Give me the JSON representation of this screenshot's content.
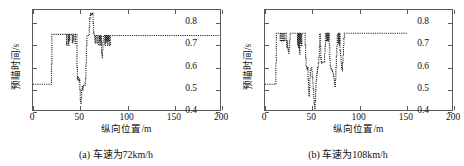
{
  "figure": {
    "background": "#ffffff",
    "axis_color": "#5a5a5a",
    "series_color": "#1a1a1a"
  },
  "panels": [
    {
      "id": "panel-a",
      "caption": "(a) 车速为72km/h",
      "xlabel": "纵向位置/m",
      "ylabel": "预瞄时间/s"
    },
    {
      "id": "panel-b",
      "caption": "(b) 车速为108km/h",
      "xlabel": "纵向位置/m",
      "ylabel": "预瞄时间/s"
    }
  ],
  "chart_data": [
    {
      "type": "line",
      "title": "(a) 车速为72km/h",
      "xlabel": "纵向位置/m",
      "ylabel": "预瞄时间/s",
      "xlim": [
        0,
        200
      ],
      "ylim": [
        0.4,
        0.86
      ],
      "xticks": [
        0,
        50,
        100,
        150,
        200
      ],
      "yticks": [
        0.4,
        0.5,
        0.6,
        0.7,
        0.8
      ],
      "xticklabels": [
        "0",
        "50",
        "100",
        "150",
        "200"
      ],
      "yticklabels": [
        "0.4",
        "0.5",
        "0.6",
        "0.7",
        "0.8"
      ],
      "grid": false,
      "legend": null,
      "linestyle": "dotted",
      "series": [
        {
          "name": "预瞄时间",
          "x": [
            0,
            1,
            2,
            3,
            4,
            5,
            6,
            7,
            8,
            9,
            10,
            11,
            12,
            13,
            14,
            15,
            16,
            17,
            18,
            19,
            19.5,
            20,
            21,
            22,
            23,
            24,
            25,
            26,
            27,
            28,
            29,
            30,
            31,
            32,
            33,
            34,
            35,
            35.5,
            36,
            36.5,
            37,
            37.5,
            38,
            38.5,
            39,
            40,
            41,
            41.5,
            42,
            42.5,
            43,
            43.5,
            44,
            44.5,
            45,
            45.5,
            46,
            46.5,
            47,
            47.5,
            48,
            48.5,
            49,
            49.5,
            50,
            50.5,
            51,
            51.5,
            52,
            52.5,
            53,
            53.5,
            54,
            54.5,
            55,
            55.5,
            56,
            56.5,
            57,
            57.5,
            58,
            58.5,
            59,
            59.5,
            60,
            60.5,
            61,
            61.5,
            62,
            62.5,
            63,
            63.5,
            64,
            64.5,
            65,
            65.5,
            66,
            66.5,
            67,
            67.5,
            68,
            68.5,
            69,
            69.5,
            70,
            70.5,
            71,
            71.5,
            72,
            72.5,
            73,
            73.5,
            74,
            74.5,
            75,
            75.5,
            76,
            76.5,
            77,
            77.5,
            78,
            78.5,
            79,
            79.5,
            80,
            80.5,
            81,
            82,
            83,
            84,
            85,
            90,
            100,
            110,
            120,
            130,
            140,
            150,
            160,
            170,
            180,
            190,
            200
          ],
          "y": [
            0.525,
            0.525,
            0.525,
            0.525,
            0.525,
            0.525,
            0.525,
            0.525,
            0.525,
            0.525,
            0.525,
            0.525,
            0.525,
            0.525,
            0.525,
            0.525,
            0.525,
            0.525,
            0.525,
            0.525,
            0.62,
            0.75,
            0.75,
            0.75,
            0.75,
            0.75,
            0.75,
            0.75,
            0.75,
            0.75,
            0.75,
            0.75,
            0.75,
            0.75,
            0.75,
            0.75,
            0.75,
            0.7,
            0.75,
            0.75,
            0.75,
            0.7,
            0.75,
            0.72,
            0.75,
            0.75,
            0.75,
            0.71,
            0.75,
            0.72,
            0.75,
            0.75,
            0.75,
            0.71,
            0.75,
            0.75,
            0.75,
            0.6,
            0.545,
            0.56,
            0.545,
            0.54,
            0.55,
            0.5,
            0.455,
            0.44,
            0.46,
            0.5,
            0.515,
            0.5,
            0.515,
            0.52,
            0.52,
            0.52,
            0.53,
            0.55,
            0.62,
            0.7,
            0.745,
            0.745,
            0.745,
            0.745,
            0.745,
            0.78,
            0.82,
            0.835,
            0.845,
            0.84,
            0.845,
            0.84,
            0.845,
            0.8,
            0.76,
            0.745,
            0.745,
            0.71,
            0.745,
            0.745,
            0.745,
            0.71,
            0.745,
            0.745,
            0.745,
            0.7,
            0.745,
            0.72,
            0.745,
            0.7,
            0.745,
            0.665,
            0.645,
            0.68,
            0.72,
            0.745,
            0.745,
            0.745,
            0.7,
            0.745,
            0.71,
            0.745,
            0.72,
            0.745,
            0.7,
            0.745,
            0.72,
            0.745,
            0.7,
            0.745,
            0.745,
            0.745,
            0.745,
            0.745,
            0.745,
            0.745,
            0.745,
            0.745,
            0.745,
            0.745,
            0.745,
            0.745,
            0.745,
            0.745,
            0.745
          ]
        }
      ]
    },
    {
      "type": "line",
      "title": "(b) 车速为108km/h",
      "xlabel": "纵向位置/m",
      "ylabel": "预瞄时间/s",
      "xlim": [
        0,
        200
      ],
      "ylim": [
        0.4,
        0.86
      ],
      "xticks": [
        0,
        50,
        100,
        150,
        200
      ],
      "yticks": [
        0.4,
        0.5,
        0.6,
        0.7,
        0.8
      ],
      "xticklabels": [
        "0",
        "50",
        "100",
        "150",
        "200"
      ],
      "yticklabels": [
        "0.4",
        "0.5",
        "0.6",
        "0.7",
        "0.8"
      ],
      "grid": false,
      "legend": null,
      "linestyle": "dotted",
      "series": [
        {
          "name": "预瞄时间",
          "x": [
            0,
            1,
            2,
            3,
            4,
            5,
            6,
            7,
            8,
            9,
            10,
            11,
            11.5,
            12,
            13,
            14,
            15,
            16,
            17,
            18,
            19,
            20,
            21,
            22,
            22.5,
            23,
            23.5,
            24,
            24.5,
            25,
            25.5,
            26,
            26.5,
            27,
            28,
            29,
            30,
            31,
            32,
            33,
            34,
            34.5,
            35,
            35.5,
            36,
            36.5,
            37,
            37.5,
            38,
            38.5,
            39,
            40,
            41,
            42,
            42.5,
            43,
            43.5,
            44,
            44.5,
            45,
            45.5,
            46,
            46.5,
            47,
            47.5,
            48,
            48.5,
            49,
            49.5,
            50,
            50.5,
            51,
            51.5,
            52,
            52.5,
            53,
            53.5,
            54,
            54.5,
            55,
            55.5,
            56,
            56.5,
            57,
            57.5,
            58,
            58.5,
            59,
            59.5,
            60,
            60.5,
            61,
            61.5,
            62,
            62.5,
            63,
            63.5,
            64,
            64.5,
            65,
            65.5,
            66,
            66.5,
            67,
            67.5,
            68,
            68.5,
            69,
            69.5,
            70,
            70.5,
            71,
            71.5,
            72,
            72.5,
            73,
            73.5,
            74,
            74.5,
            75,
            75.5,
            76,
            76.5,
            77,
            77.5,
            78,
            78.5,
            79,
            79.5,
            80,
            80.5,
            81,
            81.5,
            82,
            82.5,
            83,
            83.5,
            84,
            84.5,
            85,
            85.5,
            86,
            86.5,
            87,
            88,
            89,
            90,
            91,
            92,
            95,
            100,
            110,
            120,
            130,
            140,
            150,
            160,
            170,
            180,
            190,
            200
          ],
          "y": [
            0.525,
            0.525,
            0.525,
            0.525,
            0.525,
            0.525,
            0.525,
            0.525,
            0.525,
            0.525,
            0.525,
            0.525,
            0.62,
            0.755,
            0.755,
            0.755,
            0.755,
            0.72,
            0.755,
            0.72,
            0.755,
            0.72,
            0.755,
            0.755,
            0.72,
            0.69,
            0.72,
            0.69,
            0.68,
            0.665,
            0.69,
            0.72,
            0.755,
            0.755,
            0.755,
            0.755,
            0.755,
            0.755,
            0.755,
            0.755,
            0.755,
            0.7,
            0.755,
            0.69,
            0.755,
            0.66,
            0.755,
            0.71,
            0.755,
            0.7,
            0.755,
            0.755,
            0.755,
            0.755,
            0.7,
            0.645,
            0.61,
            0.6,
            0.59,
            0.6,
            0.55,
            0.5,
            0.47,
            0.51,
            0.555,
            0.59,
            0.6,
            0.6,
            0.585,
            0.56,
            0.53,
            0.5,
            0.465,
            0.44,
            0.415,
            0.45,
            0.5,
            0.545,
            0.565,
            0.58,
            0.6,
            0.605,
            0.62,
            0.65,
            0.7,
            0.755,
            0.7,
            0.645,
            0.62,
            0.625,
            0.625,
            0.625,
            0.625,
            0.625,
            0.625,
            0.66,
            0.7,
            0.755,
            0.755,
            0.72,
            0.755,
            0.72,
            0.755,
            0.72,
            0.755,
            0.7,
            0.64,
            0.61,
            0.6,
            0.595,
            0.59,
            0.585,
            0.58,
            0.57,
            0.56,
            0.545,
            0.53,
            0.515,
            0.545,
            0.6,
            0.65,
            0.7,
            0.745,
            0.755,
            0.71,
            0.755,
            0.7,
            0.755,
            0.68,
            0.65,
            0.62,
            0.6,
            0.585,
            0.62,
            0.66,
            0.7,
            0.73,
            0.755,
            0.755,
            0.755,
            0.755,
            0.755,
            0.755,
            0.755,
            0.755,
            0.755,
            0.755,
            0.755,
            0.755,
            0.755,
            0.755,
            0.755,
            0.755,
            0.755,
            0.755
          ]
        }
      ]
    }
  ]
}
